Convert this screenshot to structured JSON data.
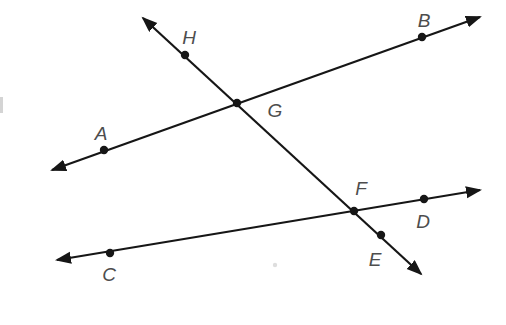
{
  "figure": {
    "width": 506,
    "height": 325,
    "background": "#ffffff",
    "line_color": "#161616",
    "label_color": "#4d4d4d",
    "label_font_size": 19,
    "dot_radius": 4.2,
    "stroke_width": 2.2,
    "lines": [
      {
        "name": "line-AB",
        "endpoints_label": "A-B",
        "from": [
          52,
          170
        ],
        "to": [
          480,
          17
        ],
        "arrows": "both"
      },
      {
        "name": "line-HE",
        "endpoints_label": "H-E",
        "from": [
          143,
          18
        ],
        "to": [
          421,
          274
        ],
        "arrows": "both"
      },
      {
        "name": "line-CD",
        "endpoints_label": "C-D",
        "from": [
          57,
          260
        ],
        "to": [
          480,
          190
        ],
        "arrows": "both"
      }
    ],
    "points": [
      {
        "label": "H",
        "dot": [
          185,
          55
        ],
        "label_pos": [
          189,
          37
        ]
      },
      {
        "label": "B",
        "dot": [
          422,
          37
        ],
        "label_pos": [
          424,
          20
        ]
      },
      {
        "label": "G",
        "dot": [
          237,
          103
        ],
        "label_pos": [
          275,
          110
        ]
      },
      {
        "label": "A",
        "dot": [
          104,
          150
        ],
        "label_pos": [
          101,
          133
        ]
      },
      {
        "label": "F",
        "dot": [
          354,
          211
        ],
        "label_pos": [
          361,
          188
        ]
      },
      {
        "label": "D",
        "dot": [
          424,
          199
        ],
        "label_pos": [
          423,
          221
        ]
      },
      {
        "label": "E",
        "dot": [
          381,
          235
        ],
        "label_pos": [
          375,
          259
        ]
      },
      {
        "label": "C",
        "dot": [
          110,
          253
        ],
        "label_pos": [
          109,
          274
        ]
      }
    ],
    "artifacts": [
      {
        "name": "scan-speck",
        "type": "dot",
        "pos": [
          275,
          265
        ],
        "color": "#dedede"
      },
      {
        "name": "edge-scan-streak",
        "type": "rect",
        "pos": [
          0,
          97
        ],
        "size": [
          3,
          16
        ],
        "color": "#d4d4d4"
      }
    ]
  }
}
